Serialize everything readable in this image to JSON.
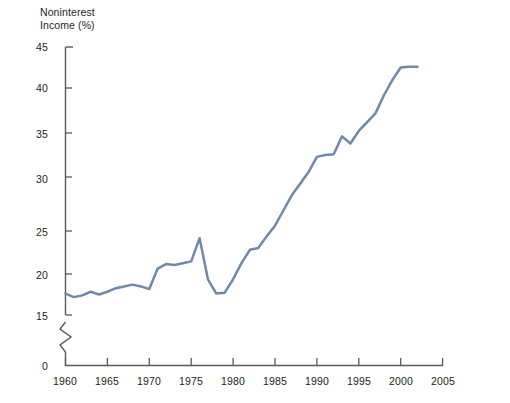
{
  "chart_data": {
    "type": "line",
    "title": "",
    "ylabel": "Noninterest\nIncome (%)",
    "xlabel": "",
    "ylim": [
      15,
      45
    ],
    "xlim": [
      1960,
      2005
    ],
    "y_axis_break": true,
    "y_axis_break_symbol": "zigzag",
    "y_tick_labels": [
      "0",
      "15",
      "20",
      "25",
      "30",
      "35",
      "40",
      "45"
    ],
    "x_tick_labels": [
      "1960",
      "1965",
      "1970",
      "1975",
      "1980",
      "1985",
      "1990",
      "1995",
      "2000",
      "2005"
    ],
    "grid": false,
    "legend": "none",
    "series_color": "#7089a8",
    "axis_color": "#58595b",
    "series": [
      {
        "name": "Noninterest Income",
        "x": [
          1960,
          1961,
          1962,
          1963,
          1964,
          1965,
          1966,
          1967,
          1968,
          1969,
          1970,
          1971,
          1972,
          1973,
          1974,
          1975,
          1976,
          1977,
          1978,
          1979,
          1980,
          1981,
          1982,
          1983,
          1984,
          1985,
          1986,
          1987,
          1988,
          1989,
          1990,
          1991,
          1992,
          1993,
          1994,
          1995,
          1996,
          1997,
          1998,
          1999,
          2000,
          2001,
          2002
        ],
        "values": [
          17.4,
          17.0,
          17.2,
          17.6,
          17.3,
          17.6,
          18.0,
          18.2,
          18.4,
          18.2,
          17.9,
          20.2,
          20.7,
          20.6,
          20.8,
          21.0,
          23.6,
          19.0,
          17.4,
          17.5,
          19.0,
          20.8,
          22.3,
          22.5,
          23.8,
          25.0,
          26.7,
          28.4,
          29.7,
          31.0,
          32.7,
          32.9,
          33.0,
          35.0,
          34.2,
          35.6,
          36.6,
          37.6,
          39.6,
          41.3,
          42.7,
          42.8,
          42.8
        ]
      }
    ]
  },
  "axis": {
    "y_title": "Noninterest\nIncome (%)",
    "ticks_y": [
      {
        "label": "45"
      },
      {
        "label": "40"
      },
      {
        "label": "35"
      },
      {
        "label": "30"
      },
      {
        "label": "25"
      },
      {
        "label": "20"
      },
      {
        "label": "15"
      },
      {
        "label": "0"
      }
    ],
    "ticks_x": [
      {
        "label": "1960"
      },
      {
        "label": "1965"
      },
      {
        "label": "1970"
      },
      {
        "label": "1975"
      },
      {
        "label": "1980"
      },
      {
        "label": "1985"
      },
      {
        "label": "1990"
      },
      {
        "label": "1995"
      },
      {
        "label": "2000"
      },
      {
        "label": "2005"
      }
    ]
  }
}
